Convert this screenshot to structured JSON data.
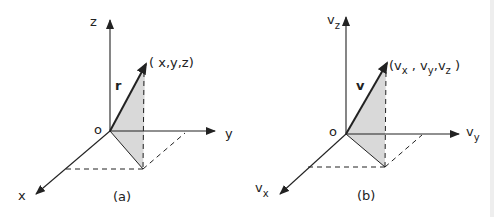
{
  "figure": {
    "panels": [
      {
        "id": "a",
        "caption": "(a)",
        "origin_label": "o",
        "axes": {
          "z": "z",
          "y": "y",
          "x": "x"
        },
        "vector_label": "r",
        "point_label": "( x,y,z)"
      },
      {
        "id": "b",
        "caption": "(b)",
        "origin_label": "o",
        "axes": {
          "z": {
            "base": "v",
            "sub": "z"
          },
          "y": {
            "base": "v",
            "sub": "y"
          },
          "x": {
            "base": "v",
            "sub": "x"
          }
        },
        "vector_label": "v",
        "point_label": {
          "open": "(",
          "c1": "v",
          "c1sub": "x",
          "sep1": " , ",
          "c2": "v",
          "c2sub": "y",
          "sep2": ",",
          "c3": "v",
          "c3sub": "z",
          "close": " )"
        }
      }
    ],
    "colors": {
      "line": "#222222",
      "shade": "#d9d9d9"
    }
  }
}
